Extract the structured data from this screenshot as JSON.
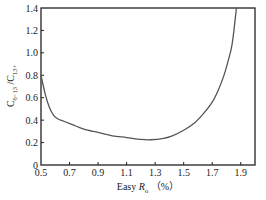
{
  "chart_data": {
    "type": "line",
    "title": "",
    "xlabel": "Easy Ro (%)",
    "xlabel_parts": {
      "prefix": "Easy ",
      "var": "R",
      "sub": "o",
      "suffix": "（%）"
    },
    "ylabel": "C6−13/C13+",
    "ylabel_parts": {
      "base1": "C",
      "sub1": "6−13",
      "sep": "/",
      "base2": "C",
      "sub2": "13+"
    },
    "xlim": [
      0.5,
      2.0
    ],
    "ylim": [
      0,
      1.4
    ],
    "xticks": [
      0.5,
      0.7,
      0.9,
      1.1,
      1.3,
      1.5,
      1.7,
      1.9
    ],
    "xtick_labels": [
      "0.5",
      "0.7",
      "0.9",
      "1.1",
      "1.3",
      "1.5",
      "1.7",
      "1.9"
    ],
    "yticks": [
      0,
      0.2,
      0.4,
      0.6,
      0.8,
      1.0,
      1.2,
      1.4
    ],
    "ytick_labels": [
      "0",
      "0.2",
      "0.4",
      "0.6",
      "0.8",
      "1.0",
      "1.2",
      "1.4"
    ],
    "grid": false,
    "legend": null,
    "series": [
      {
        "name": "C6-13/C13+ vs Easy Ro",
        "color": "#555555",
        "x": [
          0.5,
          0.53,
          0.56,
          0.59,
          0.62,
          0.66,
          0.72,
          0.8,
          0.9,
          1.0,
          1.1,
          1.2,
          1.27,
          1.35,
          1.42,
          1.5,
          1.58,
          1.64,
          1.7,
          1.74,
          1.78,
          1.81,
          1.84,
          1.87
        ],
        "y": [
          0.8,
          0.63,
          0.51,
          0.44,
          0.41,
          0.39,
          0.36,
          0.32,
          0.29,
          0.26,
          0.245,
          0.228,
          0.225,
          0.235,
          0.26,
          0.31,
          0.38,
          0.46,
          0.56,
          0.66,
          0.79,
          0.92,
          1.08,
          1.4
        ]
      }
    ]
  }
}
